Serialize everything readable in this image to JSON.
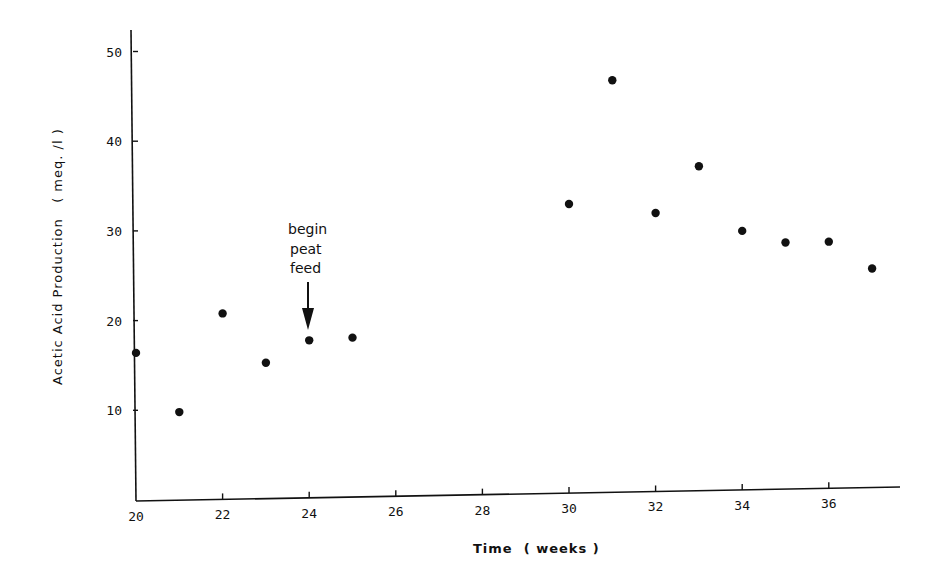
{
  "chart_data": {
    "type": "scatter",
    "title": "",
    "xlabel": "Time  ( weeks )",
    "ylabel": "Acetic Acid Production   ( meq. /l )",
    "xlim": [
      20,
      37.5
    ],
    "ylim": [
      0,
      52
    ],
    "x_ticks": [
      20,
      22,
      24,
      26,
      28,
      30,
      32,
      34,
      36
    ],
    "y_ticks": [
      10,
      20,
      30,
      40,
      50
    ],
    "grid": false,
    "legend": null,
    "series": [
      {
        "name": "Acetic acid production",
        "marker": "filled-circle",
        "color": "#111111",
        "points": [
          {
            "x": 20,
            "y": 16.4
          },
          {
            "x": 21,
            "y": 9.8
          },
          {
            "x": 22,
            "y": 20.8
          },
          {
            "x": 23,
            "y": 15.3
          },
          {
            "x": 24,
            "y": 17.8
          },
          {
            "x": 25,
            "y": 18.1
          },
          {
            "x": 30,
            "y": 33.0
          },
          {
            "x": 31,
            "y": 46.8
          },
          {
            "x": 32,
            "y": 32.0
          },
          {
            "x": 33,
            "y": 37.2
          },
          {
            "x": 34,
            "y": 30.0
          },
          {
            "x": 35,
            "y": 28.7
          },
          {
            "x": 36,
            "y": 28.8
          },
          {
            "x": 37,
            "y": 25.8
          }
        ]
      }
    ],
    "annotations": [
      {
        "text_lines": [
          "begin",
          "peat",
          "feed"
        ],
        "arrow_to": {
          "x": 24,
          "y": 17.8
        }
      }
    ]
  },
  "labels": {
    "xlabel": "Time  ( weeks )",
    "ylabel": "Acetic Acid Production   ( meq. /l )",
    "annotation": [
      "begin",
      "peat",
      "feed"
    ]
  }
}
